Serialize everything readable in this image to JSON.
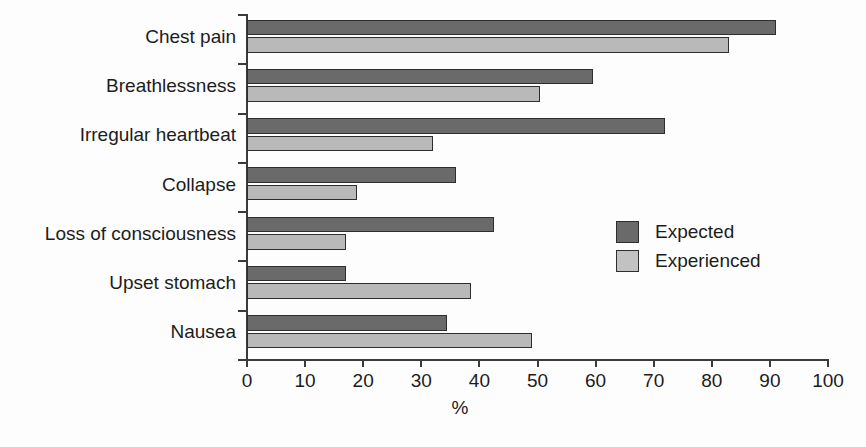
{
  "chart_data": {
    "type": "bar",
    "orientation": "horizontal",
    "title": "",
    "xlabel": "%",
    "ylabel": "",
    "xlim": [
      0,
      100
    ],
    "xticks": [
      0,
      10,
      20,
      30,
      40,
      50,
      60,
      70,
      80,
      90,
      100
    ],
    "grid": false,
    "legend_position": "center-right",
    "categories": [
      "Chest pain",
      "Breathlessness",
      "Irregular heartbeat",
      "Collapse",
      "Loss of consciousness",
      "Upset stomach",
      "Nausea"
    ],
    "series": [
      {
        "name": "Expected",
        "color": "#6a6a6a",
        "values": [
          91,
          59.5,
          72,
          36,
          42.5,
          17,
          34.5
        ]
      },
      {
        "name": "Experienced",
        "color": "#b9b9b9",
        "values": [
          83,
          50.5,
          32,
          19,
          17,
          38.5,
          49
        ]
      }
    ]
  },
  "legend": {
    "items": [
      {
        "label": "Expected",
        "swatch": "expected"
      },
      {
        "label": "Experienced",
        "swatch": "experienced"
      }
    ]
  },
  "axis": {
    "x_title": "%"
  }
}
